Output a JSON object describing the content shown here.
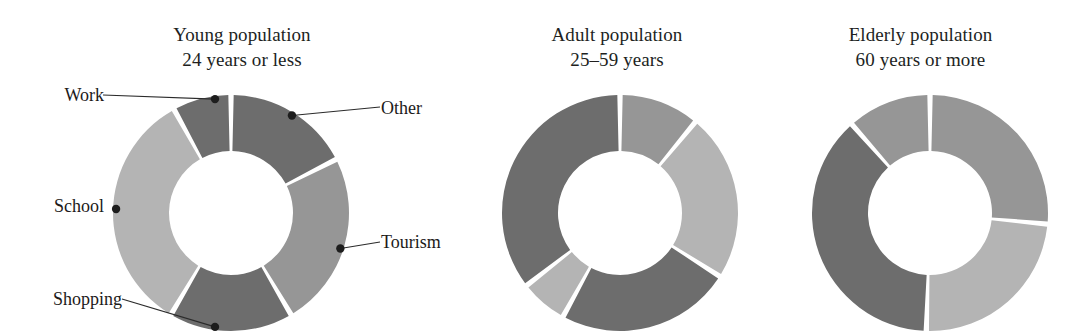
{
  "figure": {
    "background_color": "#ffffff",
    "width": 1069,
    "height": 334
  },
  "palette": {
    "dark_gray": "#6d6d6d",
    "mid_gray": "#969696",
    "light_gray": "#b4b4b4",
    "label_color": "#1c1a19",
    "leader_color": "#2b2b2b"
  },
  "panels": {
    "young": {
      "title": "Young population",
      "subtitle": "24 years or less"
    },
    "adult": {
      "title": "Adult population",
      "subtitle": "25–59 years"
    },
    "elderly": {
      "title": "Elderly population",
      "subtitle": "60 years or more"
    }
  },
  "labels": {
    "work": "Work",
    "school": "School",
    "shopping": "Shopping",
    "other": "Other",
    "tourism": "Tourism"
  },
  "chart_data": [
    {
      "type": "pie",
      "title": "Young population",
      "subtitle": "24 years or less",
      "donut": true,
      "inner_radius_ratio": 0.53,
      "start_angle_deg": 0,
      "direction": "clockwise",
      "labels_shown": true,
      "legend_position": "callout-leaders",
      "categories": [
        "Other",
        "Tourism",
        "Shopping",
        "School",
        "Work"
      ],
      "values": [
        17.5,
        24.0,
        17.0,
        33.5,
        8.0
      ],
      "colors": [
        "#6d6d6d",
        "#969696",
        "#6d6d6d",
        "#b4b4b4",
        "#6d6d6d"
      ],
      "units": "percent"
    },
    {
      "type": "pie",
      "title": "Adult population",
      "subtitle": "25–59 years",
      "donut": true,
      "inner_radius_ratio": 0.53,
      "start_angle_deg": 0,
      "direction": "clockwise",
      "labels_shown": false,
      "legend_position": "none",
      "categories": [
        "Other",
        "Tourism",
        "Shopping",
        "School",
        "Work"
      ],
      "values": [
        11.0,
        23.0,
        24.0,
        6.5,
        35.5
      ],
      "colors": [
        "#969696",
        "#b4b4b4",
        "#6d6d6d",
        "#b4b4b4",
        "#6d6d6d"
      ],
      "units": "percent"
    },
    {
      "type": "pie",
      "title": "Elderly population",
      "subtitle": "60 years or more",
      "donut": true,
      "inner_radius_ratio": 0.53,
      "start_angle_deg": 0,
      "direction": "clockwise",
      "labels_shown": false,
      "legend_position": "none",
      "categories": [
        "Other",
        "Tourism",
        "Shopping",
        "School"
      ],
      "values": [
        26.5,
        24.0,
        38.0,
        11.5
      ],
      "colors": [
        "#969696",
        "#b4b4b4",
        "#6d6d6d",
        "#969696"
      ],
      "units": "percent"
    }
  ]
}
